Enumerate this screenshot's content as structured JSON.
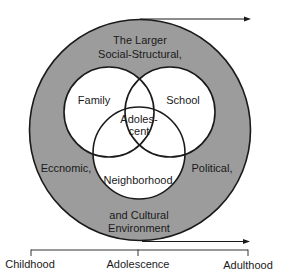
{
  "diagram": {
    "outer_ring": {
      "label_lines": [
        "The Larger",
        "Social-Structural,"
      ],
      "left_label": "Eccnomic,",
      "right_label": "Political,",
      "bottom_lines": [
        "and Cultural",
        "Environment"
      ],
      "fill_color": "#9c9c9c"
    },
    "circles": {
      "family": "Family",
      "school": "School",
      "neighborhood": "Neighborhood",
      "center_lines": [
        "Adoles-",
        "cent"
      ]
    },
    "timeline": {
      "labels": [
        "Childhood",
        "Adolescence",
        "Adulthood"
      ]
    },
    "colors": {
      "stroke": "#1a1a1a",
      "inner_fill": "#ffffff",
      "ring_fill": "#9c9c9c"
    }
  }
}
